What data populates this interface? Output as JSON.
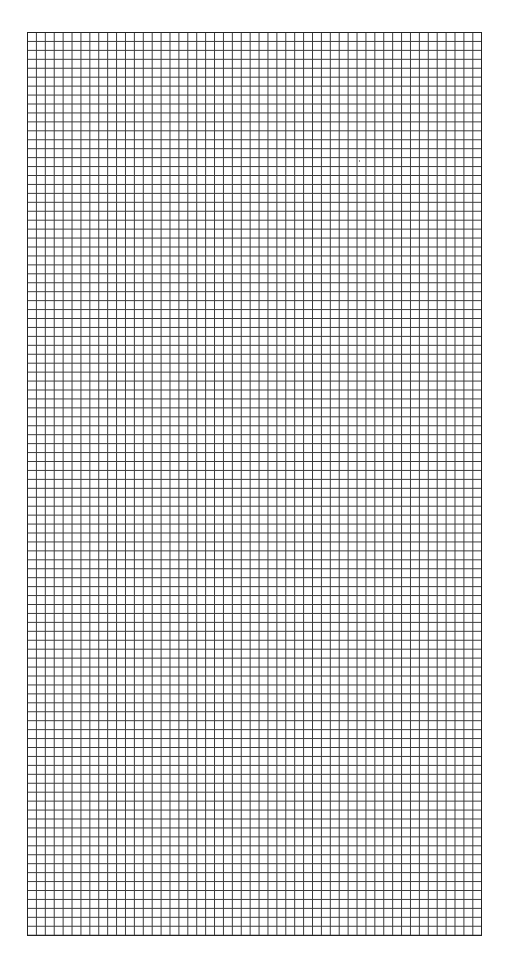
{
  "sheet": {
    "type": "grid paper",
    "columns": 51,
    "rows": 101,
    "line_color": "#3a3a3a",
    "background": "#ffffff"
  }
}
